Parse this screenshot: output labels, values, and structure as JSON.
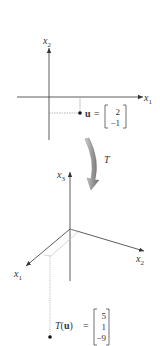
{
  "top_plot": {
    "x_axis_label": "x",
    "x_axis_sub": "1",
    "y_axis_label": "x",
    "y_axis_sub": "2",
    "vector_name": "u",
    "equals": "=",
    "vector_values": [
      "2",
      "−1"
    ]
  },
  "transform": {
    "label": "T",
    "arrow_color": "#8a8a8a"
  },
  "bottom_plot": {
    "x1_label": "x",
    "x1_sub": "1",
    "x2_label": "x",
    "x2_sub": "2",
    "x3_label": "x",
    "x3_sub": "3",
    "image_func": "T",
    "image_open": "(",
    "image_arg": "u",
    "image_close": ")",
    "equals": "=",
    "vector_values": [
      "5",
      "1",
      "−9"
    ]
  },
  "colors": {
    "axis": "#333333",
    "guide": "#888888",
    "light_guide": "#bbbbbb",
    "point": "#111111"
  }
}
